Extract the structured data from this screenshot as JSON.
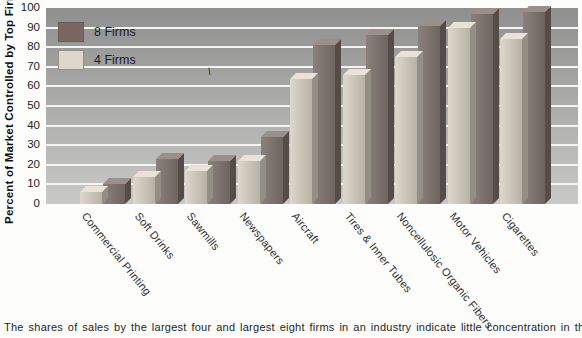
{
  "figure": {
    "y_axis_title": "Percent of Market Controlled by Top Firms",
    "caption": "The shares of sales by the largest four and largest eight firms in an industry indicate little concentration in those industries",
    "stray_mark": "\\"
  },
  "legend": {
    "position": "top-left",
    "items": [
      {
        "label": "8 Firms",
        "color": "#7b6762"
      },
      {
        "label": "4 Firms",
        "color": "#ddd8cb"
      }
    ]
  },
  "chart_data": {
    "type": "bar",
    "title": "",
    "xlabel": "",
    "ylabel": "Percent of Market Controlled by Top Firms",
    "ylim": [
      0,
      100
    ],
    "yticks": [
      0,
      10,
      20,
      30,
      40,
      50,
      60,
      70,
      80,
      90,
      100
    ],
    "grid": "horizontal-white-lines",
    "legend_position": "top-left",
    "style": "pseudo-3d-bars-on-gray-gradient-panel",
    "categories": [
      "Commercial Printing",
      "Soft Drinks",
      "Sawmills",
      "Newspapers",
      "Aircraft",
      "Tires & Inner Tubes",
      "Noncellulosic Organic Fibers",
      "Motor Vehicles",
      "Cigarettes"
    ],
    "series": [
      {
        "name": "4 Firms",
        "values": [
          6,
          14,
          17,
          22,
          64,
          66,
          75,
          90,
          84
        ],
        "face_left": "#ddd8cb",
        "face_right": "#b7b2a6",
        "top": "#e8e3d5",
        "side": "#948f85"
      },
      {
        "name": "8 Firms",
        "values": [
          10,
          23,
          22,
          34,
          81,
          86,
          91,
          97,
          98
        ],
        "face_left": "#8a807c",
        "face_right": "#6e6460",
        "top": "#9a908b",
        "side": "#554c48"
      }
    ]
  }
}
